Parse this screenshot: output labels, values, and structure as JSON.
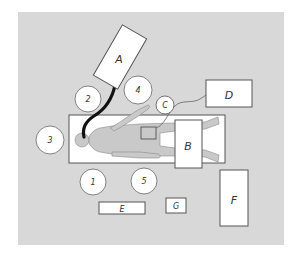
{
  "diagram": {
    "type": "operating-room-layout",
    "colors": {
      "floor": "#d8d8d8",
      "fixture_fill": "#ffffff",
      "outline": "#555555",
      "patient_fill": "#c9c9c9",
      "tube": "#111111"
    },
    "equipment": [
      {
        "id": "A",
        "label": "A"
      },
      {
        "id": "B",
        "label": "B"
      },
      {
        "id": "C",
        "label": "C"
      },
      {
        "id": "D",
        "label": "D"
      },
      {
        "id": "E",
        "label": "E"
      },
      {
        "id": "F",
        "label": "F"
      },
      {
        "id": "G",
        "label": "G"
      }
    ],
    "personnel": [
      {
        "id": "1",
        "label": "1"
      },
      {
        "id": "2",
        "label": "2"
      },
      {
        "id": "3",
        "label": "3"
      },
      {
        "id": "4",
        "label": "4"
      },
      {
        "id": "5",
        "label": "5"
      }
    ]
  }
}
